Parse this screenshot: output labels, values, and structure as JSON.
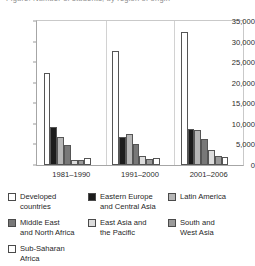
{
  "title": {
    "text": "Figure: Number of students, by region of origin"
  },
  "chart_data": {
    "type": "bar",
    "title": "",
    "xlabel": "",
    "ylabel": "",
    "ylim": [
      0,
      35000
    ],
    "grid": false,
    "legend_position": "below",
    "categories": [
      "1981–1990",
      "1991–2000",
      "2001–2006"
    ],
    "yticks": [
      "0",
      "5,000",
      "10,000",
      "15,000",
      "20,000",
      "25,000",
      "30,000",
      "35,000"
    ],
    "ytick_values": [
      0,
      5000,
      10000,
      15000,
      20000,
      25000,
      30000,
      35000
    ],
    "series": [
      {
        "name": "Developed countries",
        "color": "#ffffff",
        "values": [
          22300,
          27800,
          32300
        ]
      },
      {
        "name": "Eastern Europe and Central Asia",
        "color": "#1c1c1c",
        "values": [
          9200,
          6800,
          8700
        ]
      },
      {
        "name": "Latin America",
        "color": "#b6b6b6",
        "values": [
          6900,
          7600,
          8400
        ]
      },
      {
        "name": "Middle East and North Africa",
        "color": "#787878",
        "values": [
          4800,
          5200,
          6400
        ]
      },
      {
        "name": "East Asia and the Pacific",
        "color": "#dcdcdc",
        "values": [
          1100,
          2300,
          3700
        ]
      },
      {
        "name": "South and West Asia",
        "color": "#9a9a9a",
        "values": [
          1300,
          1500,
          2200
        ]
      },
      {
        "name": "Sub-Saharan Africa",
        "color": "#ffffff",
        "values": [
          1700,
          1700,
          1900
        ]
      }
    ]
  },
  "legend": {
    "items": [
      {
        "label": "Developed\ncountries",
        "color": "#ffffff"
      },
      {
        "label": "Eastern Europe\nand Central Asia",
        "color": "#1c1c1c"
      },
      {
        "label": "Latin America",
        "color": "#b6b6b6"
      },
      {
        "label": "Middle East\nand North Africa",
        "color": "#787878"
      },
      {
        "label": "East Asia and\nthe Pacific",
        "color": "#dcdcdc"
      },
      {
        "label": "South and\nWest Asia",
        "color": "#9a9a9a"
      },
      {
        "label": "Sub-Saharan\nAfrica",
        "color": "#ffffff"
      }
    ]
  }
}
